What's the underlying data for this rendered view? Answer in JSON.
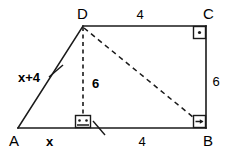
{
  "figure": {
    "kind": "geometry-diagram",
    "shape": "right trapezoid ABCD with altitude and diagonal",
    "background_color": "#ffffff",
    "ink_color": "#1a1a1a"
  },
  "vertices": [
    {
      "id": "A",
      "label": "A",
      "x": 18,
      "y": 128
    },
    {
      "id": "B",
      "label": "B",
      "x": 206,
      "y": 128
    },
    {
      "id": "C",
      "label": "C",
      "x": 206,
      "y": 26
    },
    {
      "id": "D",
      "label": "D",
      "x": 83,
      "y": 26
    }
  ],
  "vertex_labels": [
    {
      "name": "vertex-label-A",
      "text": "A",
      "x": 9,
      "y": 145
    },
    {
      "name": "vertex-label-B",
      "text": "B",
      "x": 205,
      "y": 145
    },
    {
      "name": "vertex-label-C",
      "text": "C",
      "x": 205,
      "y": 18
    },
    {
      "name": "vertex-label-D",
      "text": "D",
      "x": 79,
      "y": 18
    }
  ],
  "edges": [
    {
      "name": "edge-DC",
      "from": "D",
      "to": "C",
      "style": "solid"
    },
    {
      "name": "edge-CB",
      "from": "C",
      "to": "B",
      "style": "solid"
    },
    {
      "name": "edge-BA",
      "from": "B",
      "to": "A",
      "style": "solid"
    },
    {
      "name": "edge-AD",
      "from": "A",
      "to": "D",
      "style": "solid"
    },
    {
      "name": "diagonal-DB",
      "from": "D",
      "to": "B",
      "style": "dashed"
    },
    {
      "name": "altitude-DE",
      "from": "D",
      "to": "E",
      "style": "dashed"
    }
  ],
  "altitude": {
    "from_vertex": "D",
    "foot_x": 83,
    "foot_y": 128,
    "length_label": "6",
    "label_x": 91,
    "label_y": 83
  },
  "measures": [
    {
      "name": "length-label-dc",
      "text": "4",
      "x": 140,
      "y": 18,
      "side": "DC"
    },
    {
      "name": "length-label-cb",
      "text": "6",
      "x": 215,
      "y": 81,
      "side": "CB"
    },
    {
      "name": "length-label-eb",
      "text": "4",
      "x": 140,
      "y": 145,
      "side": "EB"
    },
    {
      "name": "length-label-altitude",
      "text": "6",
      "x": 91,
      "y": 83,
      "side": "DE"
    }
  ],
  "expressions": [
    {
      "name": "length-label-ad",
      "text": "x+4",
      "x": 20,
      "y": 77,
      "side": "AD"
    },
    {
      "name": "length-label-ae",
      "text": "x",
      "x": 49,
      "y": 145,
      "side": "AE"
    }
  ],
  "right_angles": [
    {
      "name": "right-angle-C",
      "at": "C",
      "x": 194,
      "y": 26,
      "size": 12,
      "marker": "dot"
    },
    {
      "name": "right-angle-B",
      "at": "B",
      "x": 194,
      "y": 116,
      "size": 12,
      "marker": "arrow"
    },
    {
      "name": "right-angle-E",
      "at": "E",
      "x": 75,
      "y": 116,
      "size": 14,
      "marker": "dots"
    }
  ],
  "tick_marks": [
    {
      "name": "congruence-tick-ad",
      "x1": 49,
      "y1": 76,
      "x2": 62,
      "y2": 66
    }
  ],
  "pointers": [
    {
      "name": "pointer-to-right-angle-foot",
      "x1": 93,
      "y1": 122,
      "x2": 104,
      "y2": 134
    }
  ]
}
